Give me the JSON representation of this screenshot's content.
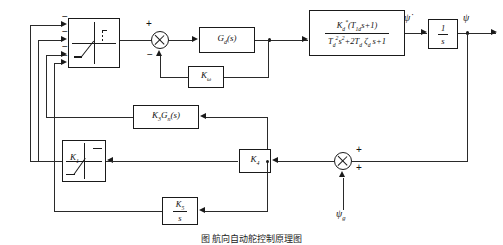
{
  "diagram": {
    "caption": "图        航向自动舵控制原理图",
    "blocks": {
      "limiter_main": {
        "name": "saturation-nonlinearity",
        "label": ""
      },
      "controller": {
        "name": "controller",
        "label": "G_d(s)",
        "num": "G",
        "sub": "d",
        "arg": "(s)"
      },
      "plant": {
        "name": "ship-dynamics",
        "numerator": "K_d*(T_1d s+1)",
        "denominator": "T_d^2 s^2 + 2T_d ζ_d s + 1"
      },
      "integrator": {
        "name": "integrator",
        "numerator": "1",
        "denominator": "s"
      },
      "rate_feedback": {
        "name": "rate-gain",
        "label": "K_ω",
        "base": "K",
        "sub": "ω"
      },
      "nonlinear_comp": {
        "name": "nonlinear-compensator",
        "label": "K_3 G_n(s)"
      },
      "limiter_k1": {
        "name": "saturation-gain-k1",
        "label": "K_1",
        "base": "K",
        "sub": "1"
      },
      "feedback_gain": {
        "name": "feedback-gain-k4",
        "label": "K_4",
        "base": "K",
        "sub": "4"
      },
      "integral_gain": {
        "name": "integral-gain-k5",
        "numerator": "K_5",
        "denominator": "s"
      }
    },
    "summing_junctions": {
      "inner": {
        "name": "inner-summing-junction",
        "signs": [
          "+",
          "−"
        ]
      },
      "outer": {
        "name": "outer-summing-junction",
        "signs": [
          "+",
          "+"
        ]
      }
    },
    "signals": {
      "psi_dot": "ψ̇",
      "psi": "ψ",
      "psi_g": "ψ",
      "psi_g_sub": "g",
      "input_signs": [
        "−",
        "−",
        "−",
        "−"
      ]
    },
    "colors": {
      "line": "#2a2a2a",
      "block_border": "#1a1a1a",
      "background": "#ffffff"
    }
  }
}
